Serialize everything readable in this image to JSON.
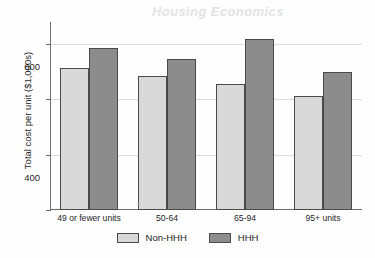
{
  "chart_data": {
    "type": "bar",
    "title": "",
    "watermark_text": "Housing Economics",
    "xlabel": "",
    "ylabel": "Total cost per unit ($1,000s)",
    "categories": [
      "49 or fewer units",
      "50-64",
      "65-94",
      "95+ units"
    ],
    "series": [
      {
        "name": "Non-HHH",
        "color": "#d9d9d9",
        "values": [
          512,
          485,
          455,
          412
        ]
      },
      {
        "name": "HHH",
        "color": "#8c8c8c",
        "values": [
          585,
          548,
          618,
          500
        ]
      }
    ],
    "ylim": [
      0,
      680
    ],
    "yticks": [
      0,
      200,
      400,
      600
    ],
    "ytick_labels": [
      "0",
      "200",
      "400",
      "600"
    ],
    "grid": true,
    "legend_position": "bottom"
  },
  "legend": {
    "items": [
      {
        "label": "Non-HHH",
        "color": "#d9d9d9"
      },
      {
        "label": "HHH",
        "color": "#8c8c8c"
      }
    ]
  },
  "smudge_glyph": "~"
}
